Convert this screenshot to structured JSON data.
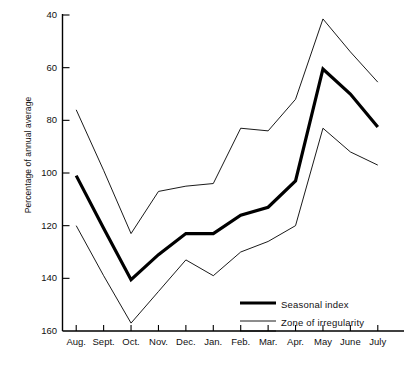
{
  "chart_data": {
    "type": "line",
    "title": "",
    "xlabel": "",
    "ylabel": "Percentage of annual average",
    "categories": [
      "Aug.",
      "Sept.",
      "Oct.",
      "Nov.",
      "Dec.",
      "Jan.",
      "Feb.",
      "Mar.",
      "Apr.",
      "May",
      "June",
      "July"
    ],
    "ylim": [
      160,
      40
    ],
    "y_inverted": true,
    "yticks": [
      40,
      60,
      80,
      100,
      120,
      140,
      160
    ],
    "grid": false,
    "legend_position": "bottom-right",
    "series": [
      {
        "name": "Seasonal index",
        "style": "thick",
        "values": [
          101,
          121,
          140.5,
          131,
          123,
          123,
          116,
          113,
          103,
          60.5,
          70,
          82.5
        ]
      },
      {
        "name": "Zone of irregularity upper",
        "style": "thin",
        "values": [
          76,
          99,
          123,
          107,
          105,
          104,
          83,
          84,
          72,
          41.5,
          54,
          65.5
        ]
      },
      {
        "name": "Zone of irregularity lower",
        "style": "thin",
        "values": [
          120,
          139,
          157,
          145,
          133,
          139,
          130,
          126,
          120,
          83,
          92,
          97
        ]
      }
    ],
    "legend": [
      {
        "label": "Seasonal index",
        "style": "thick"
      },
      {
        "label": "Zone of irregularity",
        "style": "thin-pair"
      }
    ]
  },
  "axis": {
    "line_color": "#000000",
    "tick_color": "#000000"
  }
}
